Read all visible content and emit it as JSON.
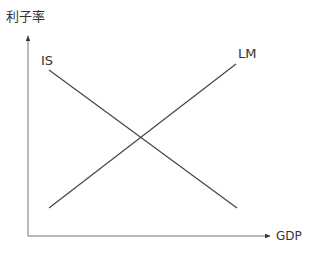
{
  "diagram": {
    "y_axis_label": "利子率",
    "x_axis_label": "GDP",
    "curves": [
      {
        "name": "IS",
        "label": "IS",
        "from": [
          49,
          70
        ],
        "to": [
          237,
          208
        ]
      },
      {
        "name": "LM",
        "label": "LM",
        "from": [
          49,
          208
        ],
        "to": [
          236,
          64
        ]
      }
    ],
    "colors": {
      "line": "#444444",
      "text": "#333333"
    }
  }
}
